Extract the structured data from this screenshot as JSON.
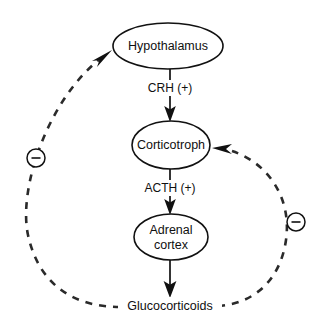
{
  "figure": {
    "background_color": "#ffffff",
    "line_color": "#111111",
    "dashed_line_color": "#2a2a2a"
  },
  "nodes": [
    {
      "id": "hypothalamus",
      "label": "Hypothalamus",
      "shape": "ellipse",
      "cx": 168,
      "cy": 46,
      "rx": 55,
      "ry": 23
    },
    {
      "id": "corticotroph",
      "label": "Corticotroph",
      "shape": "ellipse",
      "cx": 171,
      "cy": 145,
      "rx": 39,
      "ry": 24
    },
    {
      "id": "adrenal-cortex",
      "label_line1": "Adrenal",
      "label_line2": "cortex",
      "shape": "ellipse",
      "cx": 171,
      "cy": 237,
      "rx": 37,
      "ry": 23
    }
  ],
  "terminal": {
    "id": "glucocorticoids",
    "label": "Glucocorticoids",
    "x": 170,
    "y": 306
  },
  "edge_labels": [
    {
      "id": "crh",
      "label": "CRH (+)",
      "x": 170,
      "y": 88
    },
    {
      "id": "acth",
      "label": "ACTH (+)",
      "x": 170,
      "y": 188
    }
  ],
  "feedback_signs": [
    {
      "id": "left-inhibition-sign",
      "symbol": "−",
      "meaning": "negative feedback",
      "cx": 36,
      "cy": 158,
      "r": 9
    },
    {
      "id": "right-inhibition-sign",
      "symbol": "−",
      "meaning": "negative feedback",
      "cx": 296,
      "cy": 222,
      "r": 9
    }
  ],
  "edges": [
    {
      "id": "hypothalamus-to-corticotroph",
      "from": "hypothalamus",
      "to": "corticotroph",
      "style": "solid",
      "label": "CRH (+)",
      "sign": "+"
    },
    {
      "id": "corticotroph-to-adrenal-cortex",
      "from": "corticotroph",
      "to": "adrenal-cortex",
      "style": "solid",
      "label": "ACTH (+)",
      "sign": "+"
    },
    {
      "id": "adrenal-cortex-to-glucocorticoids",
      "from": "adrenal-cortex",
      "to": "glucocorticoids",
      "style": "solid",
      "label": "",
      "sign": ""
    },
    {
      "id": "glucocorticoids-to-hypothalamus-feedback",
      "from": "glucocorticoids",
      "to": "hypothalamus",
      "style": "dashed",
      "label": "",
      "sign": "−"
    },
    {
      "id": "glucocorticoids-to-corticotroph-feedback",
      "from": "glucocorticoids",
      "to": "corticotroph",
      "style": "dashed",
      "label": "",
      "sign": "−"
    }
  ]
}
